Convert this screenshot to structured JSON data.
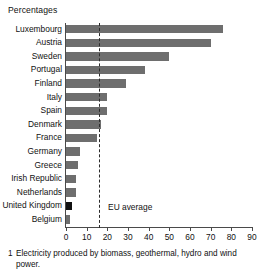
{
  "subtitle": "Percentages",
  "footnote": {
    "marker": "1",
    "text": "Electricity produced by biomass, geothermal, hydro and wind power."
  },
  "eu_average": {
    "label": "EU average",
    "value": 16
  },
  "colors": {
    "bar": "#6e6e6e",
    "highlight": "#111111",
    "axis": "#4a4a4a",
    "text": "#111111",
    "background": "#ffffff"
  },
  "chart_data": {
    "type": "bar",
    "orientation": "horizontal",
    "title": "",
    "subtitle": "Percentages",
    "xlabel": "",
    "ylabel": "",
    "xlim": [
      0,
      90
    ],
    "xticks": [
      0,
      10,
      20,
      30,
      40,
      50,
      60,
      70,
      80,
      90
    ],
    "grid": false,
    "legend": false,
    "categories": [
      "Luxembourg",
      "Austria",
      "Sweden",
      "Portugal",
      "Finland",
      "Italy",
      "Spain",
      "Denmark",
      "France",
      "Germany",
      "Greece",
      "Irish Republic",
      "Netherlands",
      "United Kingdom",
      "Belgium"
    ],
    "values": [
      76,
      70,
      50,
      38,
      29,
      20,
      20,
      17,
      15,
      7,
      6,
      5,
      5,
      3,
      2
    ],
    "highlighted": [
      "United Kingdom"
    ],
    "annotations": [
      {
        "type": "vline",
        "label": "EU average",
        "value": 16,
        "style": "dashed"
      }
    ]
  }
}
